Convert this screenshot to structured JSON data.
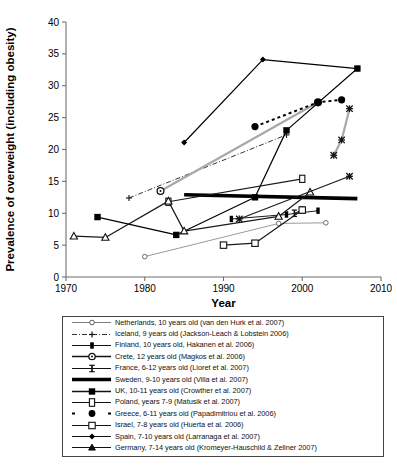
{
  "chart_data": {
    "type": "line",
    "title": "",
    "xlabel": "Year",
    "ylabel": "Prevalence of overweight (including obesity)",
    "xlim": [
      1970,
      2010
    ],
    "ylim": [
      0,
      40
    ],
    "xticks": [
      1970,
      1980,
      1990,
      2000,
      2010
    ],
    "yticks": [
      0,
      5,
      10,
      15,
      20,
      25,
      30,
      35,
      40
    ],
    "grid": false,
    "legend_position": "below",
    "series": [
      {
        "name": "Netherlands, 10 years old (van den Hurk et al. 2007)",
        "marker": "open-circle-small",
        "line": "solid-thin-gray",
        "color": "#8a8a8a",
        "points": [
          [
            1980,
            3.2
          ],
          [
            1997,
            8.4
          ],
          [
            2003,
            8.5
          ]
        ]
      },
      {
        "name": "Iceland, 9 years old (Jackson-Leach & Lobstein 2006)",
        "marker": "plus",
        "line": "dash-dot",
        "color": "#333333",
        "points": [
          [
            1978,
            12.4
          ],
          [
            1998,
            22.3
          ]
        ]
      },
      {
        "name": "Finland, 10 years old, Hakanen et al. 2006)",
        "marker": "filled-square-narrow",
        "line": "solid-thin",
        "color": "#1a1a1a",
        "points": [
          [
            1991,
            9.1
          ],
          [
            1998,
            9.8
          ],
          [
            2002,
            10.4
          ]
        ]
      },
      {
        "name": "Crete, 12 years old (Magkos et al. 2006)",
        "marker": "open-circle",
        "line": "solid-gray",
        "color": "#9a9a9a",
        "points": [
          [
            1982,
            13.5
          ],
          [
            2002,
            27.4
          ]
        ]
      },
      {
        "name": "France, 6-12 years old (Lioret et al. 2007)",
        "marker": "bar-I",
        "line": "solid-thin",
        "color": "#1a1a1a",
        "points": [
          [
            1999,
            10.0
          ],
          [
            2000,
            10.5
          ]
        ]
      },
      {
        "name": "Sweden, 9-10 years old (Villa et al. 2007)",
        "marker": "none",
        "line": "solid-thick",
        "color": "#000000",
        "points": [
          [
            1985,
            12.9
          ],
          [
            2007,
            12.3
          ]
        ]
      },
      {
        "name": "UK, 10-11 years old (Crowther et al. 2007)",
        "marker": "filled-square",
        "line": "solid",
        "color": "#000000",
        "points": [
          [
            1974,
            9.4
          ],
          [
            1984,
            6.6
          ],
          [
            1994,
            12.5
          ],
          [
            1998,
            23.0
          ],
          [
            2007,
            32.7
          ]
        ]
      },
      {
        "name": "Poland, years 7-9 (Matusik et al. 2007)",
        "marker": "open-square-tall",
        "line": "solid",
        "color": "#1a1a1a",
        "points": [
          [
            1983,
            11.8
          ],
          [
            2000,
            15.4
          ]
        ]
      },
      {
        "name": "Greece, 6-11 years old (Papadimitriou et al. 2006)",
        "marker": "filled-circle-large",
        "line": "dotted-bold",
        "color": "#000000",
        "points": [
          [
            1994,
            23.6
          ],
          [
            2002,
            27.4
          ],
          [
            2005,
            27.8
          ]
        ]
      },
      {
        "name": "Israel, 7-8 years old (Huerta et al. 2006)",
        "marker": "open-square",
        "line": "solid",
        "color": "#1a1a1a",
        "points": [
          [
            1990,
            5.0
          ],
          [
            1994,
            5.3
          ],
          [
            2000,
            10.5
          ]
        ]
      },
      {
        "name": "Spain, 7-10 years old (Larranaga et al. 2007)",
        "marker": "filled-diamond-small",
        "line": "solid",
        "color": "#000000",
        "points": [
          [
            1985,
            21.1
          ],
          [
            1995,
            34.1
          ],
          [
            2007,
            32.7
          ]
        ]
      },
      {
        "name": "Germany, 7-14 years old (Kromeyer-Hauschild & Zellner 2007)",
        "marker": "open-triangle",
        "line": "solid",
        "color": "#1a1a1a",
        "points": [
          [
            1971,
            6.4
          ],
          [
            1975,
            6.2
          ],
          [
            1983,
            11.9
          ],
          [
            1985,
            7.2
          ],
          [
            1997,
            9.5
          ],
          [
            2001,
            13.3
          ]
        ]
      },
      {
        "name": "x-marker-series-a",
        "marker": "x-star",
        "line": "solid-gray",
        "color": "#8a8a8a",
        "points": [
          [
            2004,
            19.1
          ],
          [
            2005,
            21.5
          ],
          [
            2006,
            26.4
          ]
        ]
      },
      {
        "name": "x-marker-series-b",
        "marker": "x-star",
        "line": "solid",
        "color": "#1a1a1a",
        "points": [
          [
            1992,
            9.1
          ],
          [
            2006,
            15.8
          ]
        ]
      }
    ]
  },
  "axis": {
    "ylabel": "Prevalence of overweight (including obesity)",
    "xlabel": "Year",
    "xticklabels": [
      "1970",
      "1980",
      "1990",
      "2000",
      "2010"
    ],
    "yticklabels": [
      "0",
      "5",
      "10",
      "15",
      "20",
      "25",
      "30",
      "35",
      "40"
    ]
  },
  "legend": {
    "entries": [
      {
        "key": "open-circle-small",
        "label": "Netherlands, 10 years old (van den Hurk et al. 2007)"
      },
      {
        "key": "plus-dashdot",
        "label": "Iceland, 9 years old (Jackson-Leach & Lobstein 2006)"
      },
      {
        "key": "filled-square-narrow",
        "label": "Finland, 10 years old, Hakanen et al. 2006)"
      },
      {
        "key": "open-circle",
        "label": "Crete, 12 years old (Magkos et al. 2006)"
      },
      {
        "key": "bar-I",
        "label": "France, 6-12 years old (Lioret et al. 2007)"
      },
      {
        "key": "solid-thick",
        "label": "Sweden, 9-10 years old (Villa et al. 2007)"
      },
      {
        "key": "filled-square",
        "label": "UK, 10-11 years old (Crowther et al. 2007)"
      },
      {
        "key": "open-square-tall",
        "label": "Poland, years 7-9 (Matusik et al. 2007)"
      },
      {
        "key": "dotted-filled-circle",
        "label": "Greece, 6-11 years old (Papadimitriou et al. 2006)"
      },
      {
        "key": "open-square",
        "label": "Israel, 7-8 years old (Huerta et al. 2006)"
      },
      {
        "key": "filled-diamond",
        "label": "Spain, 7-10 years old (Larranaga et al. 2007)"
      },
      {
        "key": "open-triangle",
        "label": "Germany, 7-14 years old (Kromeyer-Hauschild & Zellner 2007)"
      }
    ]
  },
  "colors": {
    "axis": "#6f6f6f",
    "ink": "#000000",
    "gray_series": "#9a9a9a",
    "legend_border": "#444444"
  }
}
